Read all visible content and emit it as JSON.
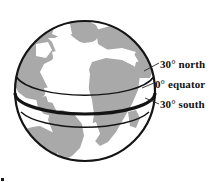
{
  "figure": {
    "type": "globe-latitude-diagram",
    "background_color": "#ffffff",
    "globe": {
      "center_x": 85,
      "center_y": 91,
      "radius": 71,
      "ocean_color": "#ffffff",
      "land_color": "#a9a9a9",
      "outline_color": "#141414",
      "outline_width": 2
    },
    "latitude_lines": [
      {
        "id": "north-30",
        "label": "30° north",
        "degrees": 30,
        "hemisphere": "north",
        "stroke_width": 1.4,
        "color": "#141414",
        "emphasis": "thin"
      },
      {
        "id": "equator-0",
        "label": "0° equator",
        "degrees": 0,
        "hemisphere": "equator",
        "stroke_width": 3.2,
        "color": "#141414",
        "emphasis": "thick"
      },
      {
        "id": "south-30",
        "label": "30° south",
        "degrees": 30,
        "hemisphere": "south",
        "stroke_width": 1.4,
        "color": "#141414",
        "emphasis": "thin"
      }
    ],
    "labels": {
      "north": "30° north",
      "equator": "0° equator",
      "south": "30° south"
    },
    "leader_lines": [
      {
        "id": "leader-north",
        "from_x": 146,
        "from_y": 70,
        "to_x": 159,
        "to_y": 63
      },
      {
        "id": "leader-equator",
        "from_x": 143,
        "from_y": 88,
        "to_x": 154,
        "to_y": 83
      },
      {
        "id": "leader-south",
        "from_x": 146,
        "from_y": 98,
        "to_x": 159,
        "to_y": 104
      }
    ],
    "corner_artifact": {
      "visible": true,
      "color": "#1a1a1a"
    }
  }
}
